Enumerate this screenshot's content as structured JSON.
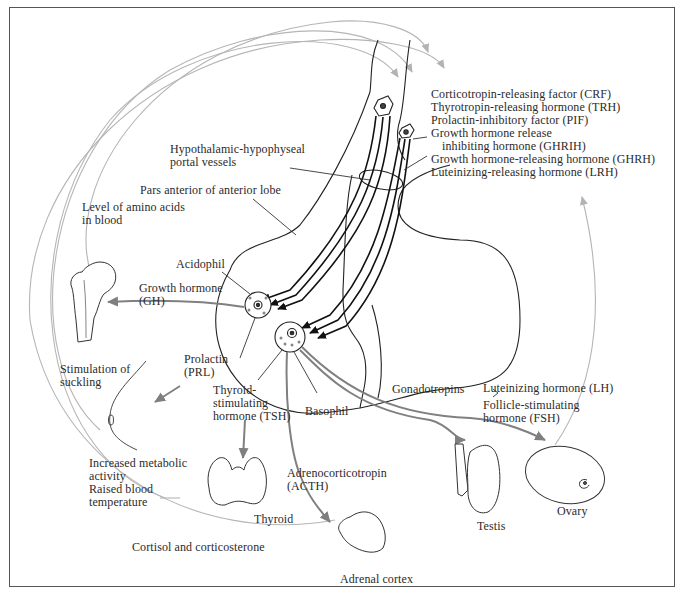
{
  "diagram": {
    "colors": {
      "frame": "#555555",
      "feedback_arc": "#b0b0b0",
      "hormone_arrow": "#808080",
      "line_art": "#222222",
      "text": "#2b2b2b"
    },
    "hypothalamic_factors": [
      "Corticotropin-releasing factor (CRF)",
      "Thyrotropin-releasing hormone (TRH)",
      "Prolactin-inhibitory factor (PIF)",
      "Growth hormone release",
      "inhibiting hormone (GHRIH)",
      "Growth hormone-releasing hormone (GHRH)",
      "Luteinizing-releasing hormone (LRH)"
    ],
    "structure_labels": {
      "portal_vessels": [
        "Hypothalamic-hypophyseal",
        "portal vessels"
      ],
      "pars_anterior": "Pars anterior of anterior lobe",
      "acidophil": "Acidophil",
      "basophil": "Basophil"
    },
    "hormones": {
      "gh": [
        "Growth hormone",
        "(GH)"
      ],
      "prl": [
        "Prolactin",
        "(PRL)"
      ],
      "tsh": [
        "Thyroid-",
        "stimulating",
        "hormone (TSH)"
      ],
      "acth": [
        "Adrenocorticotropin",
        "(ACTH)"
      ],
      "gonadotropins": "Gonadotropins",
      "lh": "Luteinizing hormone (LH)",
      "fsh": [
        "Follicle-stimulating",
        "hormone (FSH)"
      ]
    },
    "targets": {
      "thyroid": "Thyroid",
      "adrenal": "Adrenal cortex",
      "testis": "Testis",
      "ovary": "Ovary"
    },
    "feedback_labels": {
      "amino_acids": [
        "Level of amino acids",
        "in blood"
      ],
      "suckling": [
        "Stimulation of",
        "suckling"
      ],
      "metabolic": [
        "Increased metabolic",
        "activity",
        "Raised blood",
        "temperature"
      ],
      "cortisol": "Cortisol and corticosterone"
    },
    "icons": {
      "femur": "bone-icon",
      "breast": "breast-icon",
      "thyroid": "thyroid-gland-icon",
      "adrenal": "adrenal-gland-icon",
      "testis": "testis-icon",
      "ovary": "ovary-icon",
      "neuron": "neuron-cell-icon"
    }
  }
}
